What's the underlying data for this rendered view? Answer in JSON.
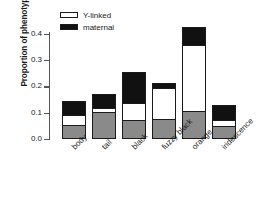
{
  "chart_data": {
    "type": "bar",
    "title": "",
    "xlabel": "",
    "ylabel": "Proportion of phenotypic varia",
    "ylim": [
      0.0,
      0.45
    ],
    "yticks": [
      "0.0",
      "0.1",
      "0.2",
      "0.3",
      "0.4"
    ],
    "ytick_values": [
      0.0,
      0.1,
      0.2,
      0.3,
      0.4
    ],
    "grid": false,
    "stacked": true,
    "legend_position": "top-left",
    "categories": [
      "body",
      "tail",
      "black",
      "fuzzy black",
      "orange",
      "iridescence"
    ],
    "series": [
      {
        "name": "residual",
        "color": "#8a8a8a",
        "values": [
          0.055,
          0.103,
          0.072,
          0.077,
          0.107,
          0.048
        ]
      },
      {
        "name": "Y-linked",
        "color": "#ffffff",
        "values": [
          0.035,
          0.015,
          0.065,
          0.118,
          0.251,
          0.024
        ]
      },
      {
        "name": "maternal",
        "color": "#111111",
        "values": [
          0.055,
          0.054,
          0.118,
          0.018,
          0.068,
          0.058
        ]
      }
    ],
    "totals": [
      0.145,
      0.172,
      0.255,
      0.213,
      0.426,
      0.13
    ]
  },
  "legend": {
    "items": [
      {
        "label": "Y-linked",
        "swatch": "white"
      },
      {
        "label": "maternal",
        "swatch": "black"
      }
    ]
  }
}
